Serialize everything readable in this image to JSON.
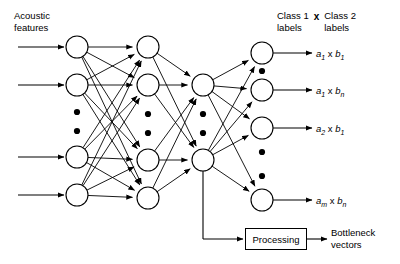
{
  "diagram": {
    "input_label": {
      "line1": "Acoustic",
      "line2": "features"
    },
    "class_header": {
      "left_line1": "Class 1",
      "left_line2": "labels",
      "operator": "x",
      "right_line1": "Class 2",
      "right_line2": "labels"
    },
    "output_labels": [
      {
        "a": "a",
        "a_sub": "1",
        "op": " x ",
        "b": "b",
        "b_sub": "1"
      },
      {
        "a": "a",
        "a_sub": "1",
        "op": " x ",
        "b": "b",
        "b_sub": "n"
      },
      {
        "a": "a",
        "a_sub": "2",
        "op": " x ",
        "b": "b",
        "b_sub": "1"
      },
      {
        "a": "a",
        "a_sub": "m",
        "op": " x ",
        "b": "b",
        "b_sub": "n"
      }
    ],
    "processing_box_label": "Processing",
    "bottleneck_output": {
      "line1": "Bottleneck",
      "line2": "vectors"
    },
    "colors": {
      "stroke": "#000000",
      "background": "#ffffff",
      "text": "#000000"
    },
    "network": {
      "node_radius": 11,
      "layers": [
        {
          "name": "input",
          "x": 77,
          "node_y": [
            47,
            85,
            157,
            195
          ],
          "ellipsis_y": [
            112,
            131
          ]
        },
        {
          "name": "hidden",
          "x": 148,
          "node_y": [
            47,
            85,
            160,
            198
          ],
          "ellipsis_y": [
            114,
            133
          ]
        },
        {
          "name": "bottleneck",
          "x": 203,
          "node_y": [
            85,
            160
          ],
          "ellipsis_y": [
            114,
            133
          ]
        },
        {
          "name": "output",
          "x": 262,
          "node_y": [
            53,
            90,
            128,
            200
          ],
          "ellipsis_y": [
            71,
            152,
            176
          ]
        }
      ],
      "input_arrows": {
        "x_start": 18,
        "x_end": 64
      },
      "output_arrows": {
        "x_start": 273,
        "x_end": 312
      },
      "tap": {
        "from_node_x": 203,
        "from_node_y": 160,
        "drop_to_y": 239,
        "elbow_x": 203,
        "arrow_to_x": 243
      },
      "processing_arrow": {
        "x_start": 307,
        "x_end": 327,
        "y": 239
      }
    }
  }
}
